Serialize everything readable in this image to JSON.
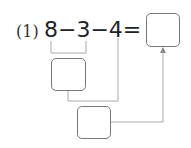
{
  "problem": {
    "label": "(1)",
    "expression": "8−3−4=",
    "tokens": [
      "8",
      "−",
      "3",
      "−",
      "4",
      "="
    ]
  },
  "boxes": {
    "answer": "",
    "step1": "",
    "step2": ""
  },
  "colors": {
    "line": "#999999",
    "box_border": "#777777",
    "text": "#222222"
  }
}
